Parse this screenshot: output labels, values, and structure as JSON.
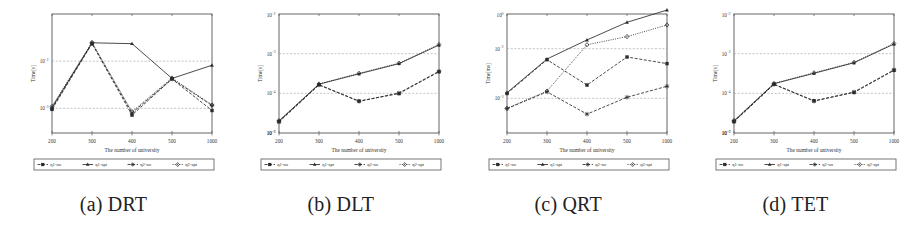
{
  "figure": {
    "panel_count": 4,
    "background_color": "#ffffff",
    "line_color": "#2b2b2b",
    "grid_color": "#9a9a9a",
    "axis_color": "#555555"
  },
  "panels": [
    {
      "caption": "(a) DRT",
      "caption_letter": "(a)",
      "caption_name": "DRT",
      "chart_data": {
        "type": "line",
        "title": "",
        "xlabel": "The number of university",
        "ylabel": "Time[s]",
        "xscale": "category",
        "yscale": "log",
        "grid": true,
        "legend_position": "below",
        "x": [
          200,
          300,
          400,
          500,
          1000
        ],
        "xtick_labels": [
          "200",
          "300",
          "400",
          "500",
          "1000"
        ],
        "ytick_labels": [
          "10^-3",
          "10^-2"
        ],
        "ytick_values": [
          0.001,
          0.01
        ],
        "ylim": [
          0.0003,
          0.1
        ],
        "series": [
          {
            "name": "q1-no",
            "marker": "square",
            "line": "dashed",
            "values": [
              0.00095,
              0.0235,
              0.00072,
              0.0042,
              0.0009
            ]
          },
          {
            "name": "q1-apt",
            "marker": "triangle",
            "line": "solid",
            "values": [
              0.00105,
              0.0245,
              0.0235,
              0.0043,
              0.0082
            ]
          },
          {
            "name": "q2-no",
            "marker": "asterisk",
            "line": "dashed",
            "values": [
              0.001,
              0.024,
              0.0008,
              0.0042,
              0.00115
            ]
          },
          {
            "name": "q2-apt",
            "marker": "diamond",
            "line": "dotted",
            "values": [
              0.0011,
              0.025,
              0.00085,
              0.0044,
              0.00118
            ]
          }
        ]
      }
    },
    {
      "caption": "(b) DLT",
      "caption_letter": "(b)",
      "caption_name": "DLT",
      "chart_data": {
        "type": "line",
        "title": "",
        "xlabel": "The number of university",
        "ylabel": "Time[s]",
        "xscale": "category",
        "yscale": "log",
        "grid": true,
        "legend_position": "below",
        "x": [
          200,
          300,
          400,
          500,
          1000
        ],
        "xtick_labels": [
          "200",
          "300",
          "400",
          "500",
          "1000"
        ],
        "ytick_labels": [
          "10^-2",
          "10^-3",
          "10^-4",
          "10^-5",
          "10^-7"
        ],
        "ytick_values": [
          0.01,
          0.001,
          0.0001,
          1e-05,
          1e-07
        ],
        "ylim": [
          1e-05,
          0.01
        ],
        "series": [
          {
            "name": "q1-no",
            "marker": "square",
            "line": "dashed",
            "values": [
              1.95e-05,
              0.000165,
              6.4e-05,
              9.85e-05,
              0.00035
            ]
          },
          {
            "name": "q1-apt",
            "marker": "triangle",
            "line": "solid",
            "values": [
              2e-05,
              0.00017,
              0.00031,
              0.00056,
              0.00165
            ]
          },
          {
            "name": "q2-no",
            "marker": "asterisk",
            "line": "dashed",
            "values": [
              1.9e-05,
              0.000163,
              6.25e-05,
              0.000102,
              0.00036
            ]
          },
          {
            "name": "q2-apt",
            "marker": "diamond",
            "line": "dotted",
            "values": [
              2.05e-05,
              0.000172,
              0.00032,
              0.000575,
              0.0017
            ]
          }
        ]
      }
    },
    {
      "caption": "(c) QRT",
      "caption_letter": "(c)",
      "caption_name": "QRT",
      "chart_data": {
        "type": "line",
        "title": "",
        "xlabel": "The number of university",
        "ylabel": "Time[ms]",
        "xscale": "category",
        "yscale": "log",
        "grid": true,
        "legend_position": "below",
        "x": [
          200,
          300,
          400,
          500,
          1000
        ],
        "xtick_labels": [
          "200",
          "300",
          "400",
          "500",
          "1000"
        ],
        "ytick_labels": [
          "10^-2",
          "10^0",
          "10^-3"
        ],
        "ytick_values": [
          0.01,
          1.0,
          0.001
        ],
        "ylim": [
          0.0002,
          0.05
        ],
        "series": [
          {
            "name": "q1-no",
            "marker": "square",
            "line": "dashed",
            "values": [
              0.00125,
              0.006,
              0.00185,
              0.0068,
              0.005
            ]
          },
          {
            "name": "q1-apt",
            "marker": "triangle",
            "line": "solid",
            "values": [
              0.0013,
              0.0062,
              0.015,
              0.034,
              0.06
            ]
          },
          {
            "name": "q2-no",
            "marker": "asterisk",
            "line": "dashed",
            "values": [
              0.00062,
              0.00135,
              0.00048,
              0.00105,
              0.00175
            ]
          },
          {
            "name": "q2-apt",
            "marker": "diamond",
            "line": "dotted",
            "values": [
              0.00063,
              0.0014,
              0.012,
              0.0175,
              0.03
            ]
          }
        ]
      }
    },
    {
      "caption": "(d) TET",
      "caption_letter": "(d)",
      "caption_name": "TET",
      "chart_data": {
        "type": "line",
        "title": "",
        "xlabel": "The number of university",
        "ylabel": "Time[s]",
        "xscale": "category",
        "yscale": "log",
        "grid": true,
        "legend_position": "below",
        "x": [
          200,
          300,
          400,
          500,
          1000
        ],
        "xtick_labels": [
          "200",
          "300",
          "400",
          "500",
          "1000"
        ],
        "ytick_labels": [
          "10^-2",
          "10^-3",
          "10^-5",
          "10^-4",
          "10^-7"
        ],
        "ytick_values": [
          0.01,
          0.001,
          1e-05,
          0.0001,
          1e-07
        ],
        "ylim": [
          1e-05,
          0.01
        ],
        "series": [
          {
            "name": "q1-no",
            "marker": "square",
            "line": "dashed",
            "values": [
              1.95e-05,
              0.00017,
              6.5e-05,
              0.000105,
              0.00038
            ]
          },
          {
            "name": "q1-apt",
            "marker": "triangle",
            "line": "solid",
            "values": [
              2e-05,
              0.000175,
              0.00032,
              0.00059,
              0.00175
            ]
          },
          {
            "name": "q2-no",
            "marker": "asterisk",
            "line": "dashed",
            "values": [
              1.92e-05,
              0.000168,
              6.35e-05,
              0.000108,
              0.00039
            ]
          },
          {
            "name": "q2-apt",
            "marker": "diamond",
            "line": "dotted",
            "values": [
              2.07e-05,
              0.000178,
              0.00033,
              0.000605,
              0.0018
            ]
          }
        ]
      }
    }
  ],
  "legend": {
    "entries": [
      {
        "label": "q1-no",
        "marker": "square",
        "line": "dashed"
      },
      {
        "label": "q1-apt",
        "marker": "triangle",
        "line": "solid"
      },
      {
        "label": "q2-no",
        "marker": "asterisk",
        "line": "dashed"
      },
      {
        "label": "q2-apt",
        "marker": "diamond",
        "line": "dotted"
      }
    ]
  }
}
